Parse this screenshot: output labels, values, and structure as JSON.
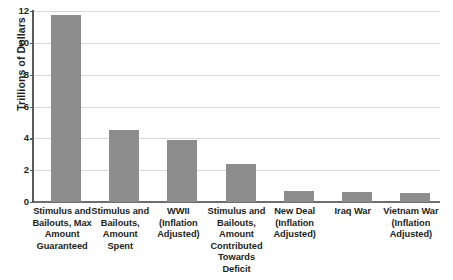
{
  "chart_data": {
    "type": "bar",
    "title": "",
    "xlabel": "",
    "ylabel": "Trillions of Dollars",
    "ylim": [
      0,
      12
    ],
    "yticks": [
      0,
      2,
      4,
      6,
      8,
      10,
      12
    ],
    "ytick_labels": [
      "0",
      "2",
      "4",
      "6",
      "8",
      "10",
      "12"
    ],
    "grid": true,
    "legend": false,
    "bar_color": "#8d8d8d",
    "categories": [
      "Stimulus and Bailouts, Max Amount Guaranteed",
      "Stimulus and Bailouts, Amount Spent",
      "WWII (Inflation Adjusted)",
      "Stimulus and Bailouts, Amount Contributed Towards Deficit",
      "New Deal (Inflation Adjusted)",
      "Iraq War",
      "Vietnam War (Inflation Adjusted)"
    ],
    "category_lines": [
      [
        "Stimulus and",
        "Bailouts, Max",
        "Amount",
        "Guaranteed"
      ],
      [
        "Stimulus and",
        "Bailouts,",
        "Amount",
        "Spent"
      ],
      [
        "WWII",
        "(Inflation",
        "Adjusted)"
      ],
      [
        "Stimulus and",
        "Bailouts,",
        "Amount",
        "Contributed",
        "Towards Deficit"
      ],
      [
        "New Deal",
        "(Inflation",
        "Adjusted)"
      ],
      [
        "Iraq War"
      ],
      [
        "Vietnam War",
        "(Inflation",
        "Adjusted)"
      ]
    ],
    "values": [
      11.75,
      4.5,
      3.9,
      2.4,
      0.68,
      0.62,
      0.56
    ]
  }
}
